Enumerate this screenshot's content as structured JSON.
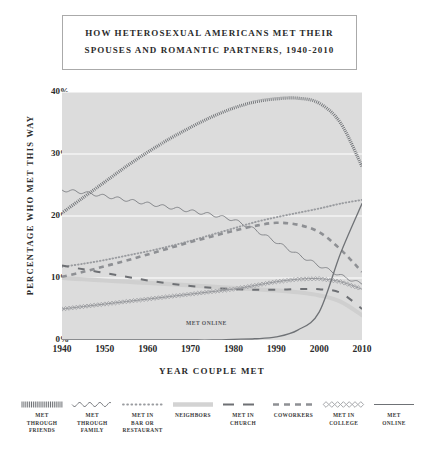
{
  "title": {
    "line1": "HOW HETEROSEXUAL AMERICANS MET THEIR",
    "line2": "SPOUSES AND ROMANTIC PARTNERS, 1940-2010"
  },
  "annotation": {
    "met_online": "MET ONLINE"
  },
  "legend": [
    {
      "label": "MET\nTHROUGH\nFRIENDS",
      "key": "friends",
      "style": "hatch"
    },
    {
      "label": "MET\nTHROUGH\nFAMILY",
      "key": "family",
      "style": "wavy"
    },
    {
      "label": "MET IN\nBAR OR\nRESTAURANT",
      "key": "bar",
      "style": "dotted"
    },
    {
      "label": "NEIGHBORS",
      "key": "neighbors",
      "style": "band"
    },
    {
      "label": "MET IN\nCHURCH",
      "key": "church",
      "style": "longdash"
    },
    {
      "label": "COWORKERS",
      "key": "coworkers",
      "style": "dash"
    },
    {
      "label": "MET IN\nCOLLEGE",
      "key": "college",
      "style": "diamond"
    },
    {
      "label": "MET\nONLINE",
      "key": "online",
      "style": "solid"
    }
  ],
  "chart_data": {
    "type": "line",
    "title": "HOW HETEROSEXUAL AMERICANS MET THEIR SPOUSES AND ROMANTIC PARTNERS, 1940-2010",
    "xlabel": "YEAR COUPLE MET",
    "ylabel": "PERCENTAGE WHO MET THIS WAY",
    "xlim": [
      1940,
      2010
    ],
    "ylim": [
      0,
      40
    ],
    "xticks": [
      1940,
      1950,
      1960,
      1970,
      1980,
      1990,
      2000,
      2010
    ],
    "yticks": [
      "0%",
      "10%",
      "20%",
      "30%",
      "40%"
    ],
    "grid": "horizontal-white",
    "legend_position": "bottom",
    "x": [
      1940,
      1945,
      1950,
      1955,
      1960,
      1965,
      1970,
      1975,
      1980,
      1985,
      1990,
      1995,
      2000,
      2005,
      2010
    ],
    "series": [
      {
        "name": "MET THROUGH FRIENDS",
        "key": "friends",
        "values": [
          20.5,
          23.0,
          25.5,
          28.0,
          30.3,
          32.4,
          34.3,
          36.0,
          37.4,
          38.4,
          38.9,
          39.0,
          38.2,
          35.0,
          28.0
        ]
      },
      {
        "name": "MET THROUGH FAMILY",
        "key": "family",
        "values": [
          24.2,
          23.8,
          23.2,
          22.6,
          22.0,
          21.4,
          20.8,
          20.2,
          19.4,
          17.8,
          15.8,
          13.8,
          12.0,
          10.4,
          9.0
        ]
      },
      {
        "name": "MET IN BAR OR RESTAURANT",
        "key": "bar",
        "values": [
          11.8,
          12.3,
          12.9,
          13.6,
          14.3,
          15.1,
          16.0,
          17.0,
          18.0,
          19.0,
          19.8,
          20.5,
          21.2,
          22.0,
          22.6
        ]
      },
      {
        "name": "NEIGHBORS",
        "key": "neighbors",
        "values": [
          10.0,
          9.8,
          9.6,
          9.4,
          9.2,
          9.0,
          8.8,
          8.6,
          8.4,
          8.2,
          8.0,
          7.7,
          7.2,
          6.2,
          4.0
        ]
      },
      {
        "name": "MET IN CHURCH",
        "key": "church",
        "values": [
          12.0,
          11.4,
          10.8,
          10.2,
          9.6,
          9.1,
          8.7,
          8.4,
          8.2,
          8.1,
          8.1,
          8.2,
          8.2,
          7.6,
          5.0
        ]
      },
      {
        "name": "COWORKERS",
        "key": "coworkers",
        "values": [
          10.2,
          11.0,
          11.9,
          12.8,
          13.8,
          14.8,
          15.8,
          16.7,
          17.6,
          18.4,
          18.9,
          18.6,
          17.4,
          14.6,
          11.0
        ]
      },
      {
        "name": "MET IN COLLEGE",
        "key": "college",
        "values": [
          5.0,
          5.4,
          5.8,
          6.2,
          6.6,
          7.0,
          7.4,
          7.8,
          8.2,
          8.8,
          9.4,
          9.8,
          9.9,
          9.4,
          8.2
        ]
      },
      {
        "name": "MET ONLINE",
        "key": "online",
        "values": [
          0.0,
          0.0,
          0.0,
          0.0,
          0.0,
          0.0,
          0.0,
          0.0,
          0.1,
          0.2,
          0.5,
          1.6,
          4.5,
          14.0,
          22.0
        ]
      }
    ]
  }
}
